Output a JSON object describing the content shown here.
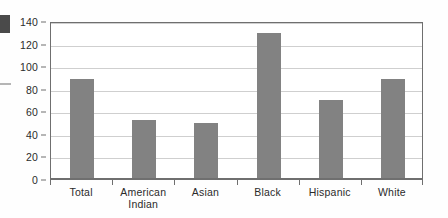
{
  "chart_data": {
    "type": "bar",
    "title": "",
    "xlabel": "",
    "ylabel": "",
    "categories": [
      "Total",
      "American Indian",
      "Asian",
      "Black",
      "Hispanic",
      "White"
    ],
    "category_lines": [
      [
        "Total"
      ],
      [
        "American",
        "Indian"
      ],
      [
        "Asian"
      ],
      [
        "Black"
      ],
      [
        "Hispanic"
      ],
      [
        "White"
      ]
    ],
    "values": [
      89,
      52,
      50,
      129,
      70,
      89
    ],
    "ylim": [
      0,
      140
    ],
    "ytick_values": [
      0,
      20,
      40,
      60,
      80,
      100,
      120,
      140
    ],
    "ytick_labels": [
      "0",
      "20",
      "40",
      "60",
      "80",
      "100",
      "120",
      "140"
    ],
    "grid": true,
    "legend": false,
    "bar_color": "#828282",
    "axis_color": "#6f6f6f",
    "grid_color": "#cfcfcf",
    "text_color": "#2b2b2b"
  },
  "artifacts": {
    "left_block_label": "scan-artifact-block",
    "left_dash_label": "scan-artifact-dash"
  }
}
